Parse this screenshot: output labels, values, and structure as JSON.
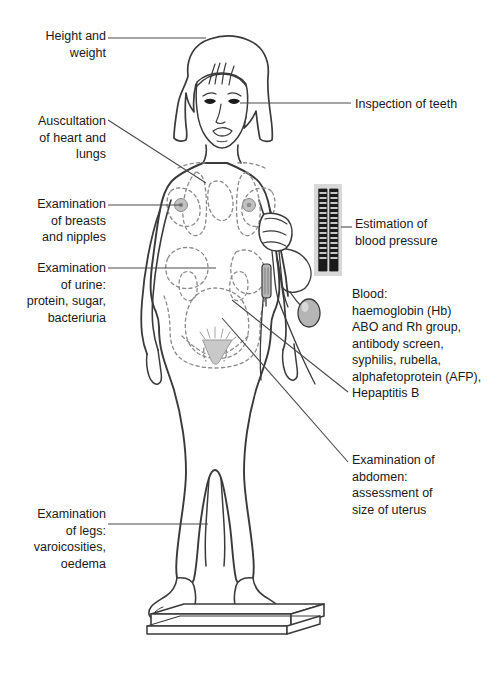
{
  "diagram": {
    "line_color": "#3a3a3a",
    "text_color": "#1a1a1a",
    "background_color": "#ffffff",
    "labels": [
      {
        "id": "height-weight",
        "text": "Height and\nweight",
        "align": "right",
        "x": 14,
        "y": 28,
        "width": 92
      },
      {
        "id": "auscultation",
        "text": "Auscultation\nof heart and\nlungs",
        "align": "right",
        "x": 14,
        "y": 113,
        "width": 92
      },
      {
        "id": "breasts",
        "text": "Examination\nof breasts\nand nipples",
        "align": "right",
        "x": 14,
        "y": 196,
        "width": 92
      },
      {
        "id": "urine",
        "text": "Examination\nof urine:\nprotein, sugar,\nbacteriuria",
        "align": "right",
        "x": 4,
        "y": 260,
        "width": 102
      },
      {
        "id": "legs",
        "text": "Examination\nof legs:\nvaroicosities,\noedema",
        "align": "right",
        "x": 4,
        "y": 506,
        "width": 102
      },
      {
        "id": "teeth",
        "text": "Inspection of teeth",
        "align": "left",
        "x": 355,
        "y": 96,
        "width": 140
      },
      {
        "id": "blood-pressure",
        "text": "Estimation of\nblood pressure",
        "align": "left",
        "x": 355,
        "y": 216,
        "width": 140
      },
      {
        "id": "blood-tests",
        "text": "Blood:\nhaemoglobin (Hb)\nABO and Rh group,\nantibody screen,\nsyphilis, rubella,\nalphafetoprotein (AFP),\nHepaptitis B",
        "align": "left",
        "x": 352,
        "y": 286,
        "width": 150
      },
      {
        "id": "abdomen",
        "text": "Examination of\nabdomen:\nassessment of\nsize of uterus",
        "align": "left",
        "x": 352,
        "y": 452,
        "width": 150
      }
    ],
    "leader_lines": [
      {
        "id": "height-weight",
        "x1": 108,
        "y1": 38,
        "x2": 206,
        "y2": 38
      },
      {
        "id": "teeth",
        "x1": 240,
        "y1": 103,
        "x2": 351,
        "y2": 103
      },
      {
        "id": "auscultation",
        "x1": 108,
        "y1": 120,
        "x2": 206,
        "y2": 183
      },
      {
        "id": "breasts",
        "x1": 108,
        "y1": 205,
        "x2": 182,
        "y2": 205
      },
      {
        "id": "blood-pressure",
        "x1": 342,
        "y1": 227,
        "x2": 352,
        "y2": 227
      },
      {
        "id": "urine",
        "x1": 108,
        "y1": 268,
        "x2": 216,
        "y2": 268
      },
      {
        "id": "blood-tests",
        "x1": 232,
        "y1": 300,
        "x2": 348,
        "y2": 392
      },
      {
        "id": "abdomen",
        "x1": 222,
        "y1": 318,
        "x2": 348,
        "y2": 462
      },
      {
        "id": "legs",
        "x1": 108,
        "y1": 524,
        "x2": 208,
        "y2": 524
      }
    ],
    "equipment": {
      "sphygmomanometer": {
        "name": "mercury sphygmomanometer gauge",
        "panel_color": "#d8d8d8",
        "column_color": "#1a1a1a",
        "x": 314,
        "y": 184,
        "width": 28,
        "height": 92
      },
      "cuff": {
        "name": "blood pressure cuff on upper arm"
      },
      "bulb": {
        "name": "inflation bulb",
        "color": "#b5b5b5"
      },
      "scale": {
        "name": "weighing scale platform"
      }
    },
    "anatomy_overlays": [
      "lungs",
      "heart",
      "breasts",
      "nipples",
      "kidneys",
      "liver",
      "intestines",
      "uterus",
      "pubic-triangle"
    ]
  }
}
